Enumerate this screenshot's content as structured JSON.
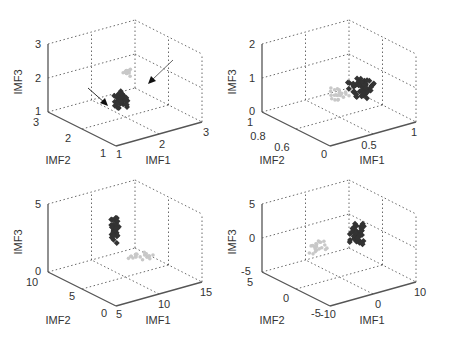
{
  "chart_data": [
    {
      "type": "scatter",
      "subtype": "scatter3d",
      "position": "top-left",
      "xlabel": "IMF1",
      "ylabel": "IMF2",
      "zlabel": "IMF3",
      "xlim": [
        1,
        3
      ],
      "ylim": [
        1,
        3
      ],
      "zlim": [
        1,
        3
      ],
      "xticks": [
        "1",
        "2",
        "3"
      ],
      "yticks": [
        "1",
        "2",
        "3"
      ],
      "zticks": [
        "1",
        "2",
        "3"
      ],
      "grid": true,
      "annotations": [
        "arrow pointing to dark cluster",
        "arrow pointing to light cluster"
      ],
      "series": [
        {
          "name": "class-light",
          "color": "#c8c8c8",
          "center_px": [
            128,
            72
          ],
          "spread_px": [
            8,
            5
          ],
          "count": 16
        },
        {
          "name": "class-dark",
          "color": "#333333",
          "center_px": [
            122,
            100
          ],
          "spread_px": [
            10,
            11
          ],
          "count": 45
        }
      ]
    },
    {
      "type": "scatter",
      "subtype": "scatter3d",
      "position": "top-right",
      "xlabel": "IMF1",
      "ylabel": "IMF2",
      "zlabel": "IMF3",
      "xlim": [
        0,
        1
      ],
      "ylim": [
        0.5,
        1
      ],
      "zlim": [
        0,
        2
      ],
      "xticks": [
        "0",
        "0.5",
        "1"
      ],
      "yticks": [
        "0.6",
        "0.8",
        "1"
      ],
      "zticks": [
        "0",
        "1",
        "2"
      ],
      "grid": true,
      "series": [
        {
          "name": "class-light",
          "color": "#c8c8c8",
          "center_px": [
            340,
            95
          ],
          "spread_px": [
            14,
            12
          ],
          "count": 25
        },
        {
          "name": "class-dark",
          "color": "#333333",
          "center_px": [
            362,
            88
          ],
          "spread_px": [
            20,
            13
          ],
          "count": 55
        }
      ]
    },
    {
      "type": "scatter",
      "subtype": "scatter3d",
      "position": "bottom-left",
      "xlabel": "IMF1",
      "ylabel": "IMF2",
      "zlabel": "IMF3",
      "xlim": [
        5,
        15
      ],
      "ylim": [
        0,
        10
      ],
      "zlim": [
        0,
        5
      ],
      "xticks": [
        "5",
        "10",
        "15"
      ],
      "yticks": [
        "0",
        "5",
        "10"
      ],
      "zticks": [
        "0",
        "5"
      ],
      "grid": true,
      "series": [
        {
          "name": "class-light",
          "color": "#c8c8c8",
          "center_px": [
            143,
            255
          ],
          "spread_px": [
            18,
            7
          ],
          "count": 22
        },
        {
          "name": "class-dark",
          "color": "#333333",
          "center_px": [
            115,
            230
          ],
          "spread_px": [
            5,
            17
          ],
          "count": 40
        }
      ]
    },
    {
      "type": "scatter",
      "subtype": "scatter3d",
      "position": "bottom-right",
      "xlabel": "IMF1",
      "ylabel": "IMF2",
      "zlabel": "IMF3",
      "xlim": [
        -10,
        10
      ],
      "ylim": [
        -5,
        5
      ],
      "zlim": [
        -5,
        5
      ],
      "xticks": [
        "-10",
        "0",
        "10"
      ],
      "yticks": [
        "-5",
        "0",
        "5"
      ],
      "zticks": [
        "-5",
        "0",
        "5"
      ],
      "grid": true,
      "series": [
        {
          "name": "class-light",
          "color": "#c8c8c8",
          "center_px": [
            318,
            248
          ],
          "spread_px": [
            12,
            14
          ],
          "count": 24
        },
        {
          "name": "class-dark",
          "color": "#333333",
          "center_px": [
            357,
            235
          ],
          "spread_px": [
            10,
            18
          ],
          "count": 42
        }
      ]
    }
  ],
  "plots": [
    {
      "id": "p1",
      "ox": 0,
      "oy": 0,
      "zlabel": "IMF3",
      "ylabel": "IMF2",
      "xlabel": "IMF1",
      "zticks": [
        {
          "t": "3",
          "x": 38,
          "y": 48
        },
        {
          "t": "2",
          "x": 38,
          "y": 82
        },
        {
          "t": "1",
          "x": 38,
          "y": 115
        }
      ],
      "yticks": [
        {
          "t": "3",
          "x": 36,
          "y": 126
        },
        {
          "t": "2",
          "x": 68,
          "y": 142
        },
        {
          "t": "1",
          "x": 103,
          "y": 157
        }
      ],
      "xticks": [
        {
          "t": "1",
          "x": 119,
          "y": 158
        },
        {
          "t": "2",
          "x": 162,
          "y": 148
        },
        {
          "t": "3",
          "x": 206,
          "y": 136
        }
      ]
    },
    {
      "id": "p2",
      "ox": 214,
      "oy": 0,
      "zlabel": "IMF3",
      "ylabel": "IMF2",
      "xlabel": "IMF1",
      "zticks": [
        {
          "t": "2",
          "x": 38,
          "y": 48
        },
        {
          "t": "1",
          "x": 38,
          "y": 82
        },
        {
          "t": "0",
          "x": 38,
          "y": 115
        }
      ],
      "yticks": [
        {
          "t": "1",
          "x": 36,
          "y": 126
        },
        {
          "t": "0.8",
          "x": 44,
          "y": 140
        },
        {
          "t": "0.6",
          "x": 68,
          "y": 151
        }
      ],
      "xticks": [
        {
          "t": "0",
          "x": 110,
          "y": 158
        },
        {
          "t": "0.5",
          "x": 155,
          "y": 149
        },
        {
          "t": "1",
          "x": 200,
          "y": 136
        }
      ]
    },
    {
      "id": "p3",
      "ox": 0,
      "oy": 160,
      "zlabel": "IMF3",
      "ylabel": "IMF2",
      "xlabel": "IMF1",
      "zticks": [
        {
          "t": "5",
          "x": 38,
          "y": 48
        },
        {
          "t": "0",
          "x": 38,
          "y": 115
        }
      ],
      "yticks": [
        {
          "t": "10",
          "x": 32,
          "y": 126
        },
        {
          "t": "5",
          "x": 72,
          "y": 140
        },
        {
          "t": "0",
          "x": 104,
          "y": 157
        }
      ],
      "xticks": [
        {
          "t": "5",
          "x": 119,
          "y": 158
        },
        {
          "t": "10",
          "x": 164,
          "y": 148
        },
        {
          "t": "15",
          "x": 206,
          "y": 136
        }
      ]
    },
    {
      "id": "p4",
      "ox": 214,
      "oy": 160,
      "zlabel": "IMF3",
      "ylabel": "IMF2",
      "xlabel": "IMF1",
      "zticks": [
        {
          "t": "5",
          "x": 38,
          "y": 48
        },
        {
          "t": "0",
          "x": 38,
          "y": 82
        },
        {
          "t": "-5",
          "x": 32,
          "y": 115
        }
      ],
      "yticks": [
        {
          "t": "5",
          "x": 36,
          "y": 126
        },
        {
          "t": "0",
          "x": 72,
          "y": 142
        },
        {
          "t": "-5",
          "x": 102,
          "y": 157
        }
      ],
      "xticks": [
        {
          "t": "-10",
          "x": 114,
          "y": 158
        },
        {
          "t": "0",
          "x": 164,
          "y": 148
        },
        {
          "t": "10",
          "x": 206,
          "y": 136
        }
      ]
    }
  ],
  "colors": {
    "light": "#c8c8c8",
    "dark": "#333333",
    "axis": "#555555"
  }
}
